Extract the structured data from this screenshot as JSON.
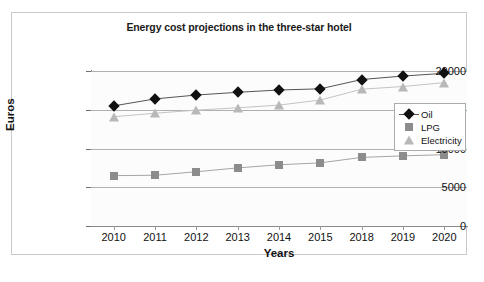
{
  "chart_data": {
    "type": "line",
    "title": "Energy cost projections in the three-star hotel",
    "xlabel": "Years",
    "ylabel": "Euros",
    "categories": [
      "2010",
      "2011",
      "2012",
      "2013",
      "2014",
      "2015",
      "2018",
      "2019",
      "2020"
    ],
    "ylim": [
      0,
      20000
    ],
    "yticks": [
      0,
      5000,
      10000,
      15000,
      20000
    ],
    "ytick_labels": [
      "0",
      "5000",
      "10000",
      "15000",
      "20000"
    ],
    "grid": true,
    "legend_position": "right-inside",
    "series": [
      {
        "name": "Oil",
        "marker": "diamond",
        "color": "#111111",
        "values": [
          15500,
          16400,
          16900,
          17250,
          17550,
          17700,
          18900,
          19350,
          19700
        ]
      },
      {
        "name": "LPG",
        "marker": "square",
        "color": "#8c8c8c",
        "values": [
          6500,
          6550,
          7000,
          7500,
          7900,
          8150,
          8850,
          9050,
          9200
        ]
      },
      {
        "name": "Electricity",
        "marker": "triangle",
        "color": "#b8b8b8",
        "values": [
          14100,
          14550,
          14950,
          15250,
          15600,
          16250,
          17650,
          18000,
          18500
        ]
      }
    ]
  }
}
